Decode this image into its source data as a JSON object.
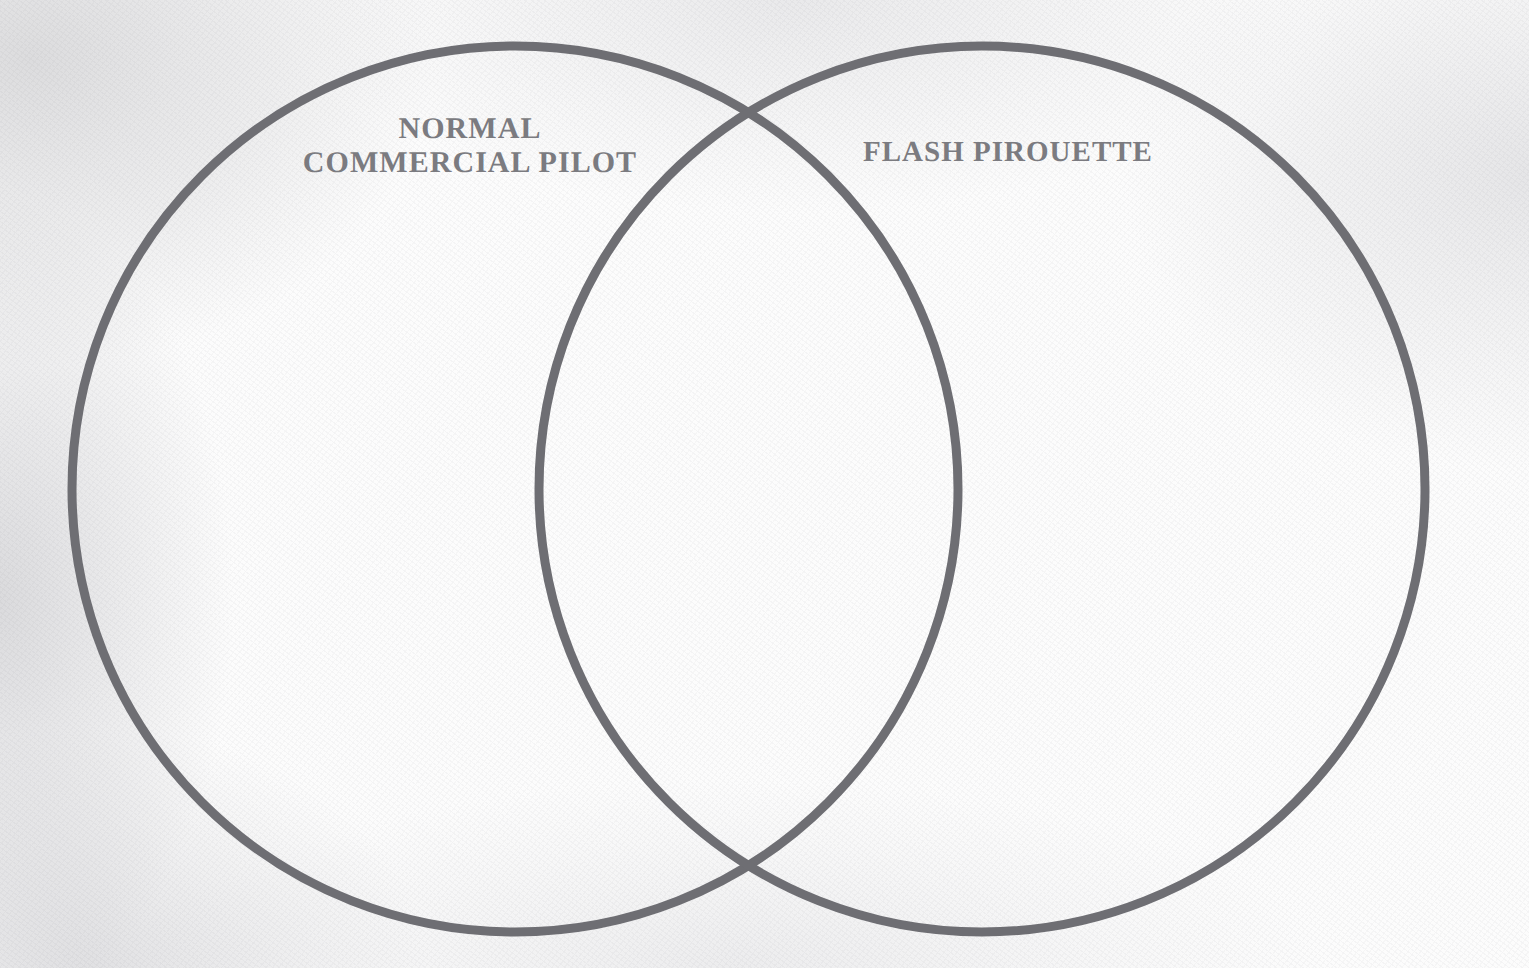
{
  "figure": {
    "kind": "venn-diagram",
    "sets_count": 2,
    "stroke_color": "#6e6e73",
    "stroke_width_px": 9,
    "background_color": "#fcfcfc",
    "label_color": "#7b7b80",
    "canvas": {
      "width": 1529,
      "height": 968
    }
  },
  "circles": {
    "left": {
      "name": "normal-commercial-pilot",
      "cx": 515,
      "cy": 489,
      "r": 443
    },
    "right": {
      "name": "flash-pirouette",
      "cx": 982,
      "cy": 489,
      "r": 443
    }
  },
  "labels": {
    "left": {
      "text": "NORMAL\nCOMMERCIAL PILOT",
      "line_1": "NORMAL",
      "line_2": "COMMERCIAL PILOT"
    },
    "right": {
      "text": "FLASH PIROUETTE",
      "line_1": "FLASH PIROUETTE"
    },
    "overlap": {
      "text": ""
    }
  },
  "regions": {
    "left_only_items": [],
    "right_only_items": [],
    "overlap_items": []
  }
}
